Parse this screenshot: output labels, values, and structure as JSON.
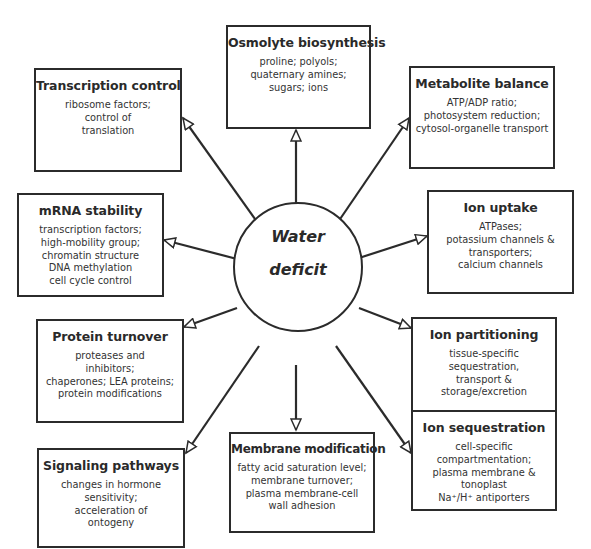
{
  "center": {
    "line1": "Water",
    "line2": "deficit"
  },
  "boxes": [
    {
      "id": "osmolyte",
      "title": "Osmolyte biosynthesis",
      "lines": [
        "proline; polyols;",
        "quaternary amines;",
        "sugars; ions"
      ]
    },
    {
      "id": "transcription",
      "title": "Transcription control",
      "lines": [
        "ribosome factors;",
        "control of",
        "translation"
      ]
    },
    {
      "id": "metabolite",
      "title": "Metabolite balance",
      "lines": [
        "ATP/ADP ratio;",
        "photosystem reduction;",
        "cytosol-organelle transport"
      ]
    },
    {
      "id": "mrna",
      "title": "mRNA stability",
      "lines": [
        "transcription factors;",
        "high-mobility group;",
        "chromatin structure",
        "DNA methylation",
        "cell cycle control"
      ]
    },
    {
      "id": "ion-uptake",
      "title": "Ion uptake",
      "lines": [
        "ATPases;",
        "potassium channels &",
        "transporters;",
        "calcium channels"
      ]
    },
    {
      "id": "protein",
      "title": "Protein turnover",
      "lines": [
        "proteases and",
        "inhibitors;",
        "chaperones; LEA proteins;",
        "protein modifications"
      ]
    },
    {
      "id": "ion-partitioning",
      "title": "Ion partitioning",
      "lines": [
        "tissue-specific",
        "sequestration,",
        "transport &",
        "storage/excretion"
      ]
    },
    {
      "id": "signaling",
      "title": "Signaling pathways",
      "lines": [
        "changes in hormone",
        "sensitivity;",
        "acceleration of",
        "ontogeny"
      ]
    },
    {
      "id": "membrane",
      "title": "Membrane modification",
      "lines": [
        "fatty acid saturation level;",
        "membrane turnover;",
        "plasma membrane-cell",
        "wall adhesion"
      ]
    },
    {
      "id": "ion-sequestration",
      "title": "Ion sequestration",
      "lines": [
        "cell-specific",
        "compartmentation;",
        "plasma membrane &",
        "tonoplast",
        "Na⁺/H⁺ antiporters"
      ]
    }
  ]
}
